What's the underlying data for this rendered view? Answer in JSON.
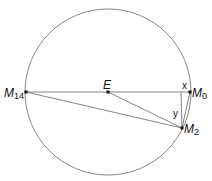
{
  "diagram": {
    "labels": {
      "center": "E",
      "m0": "M",
      "m0_sub": "0",
      "m2": "M",
      "m2_sub": "2",
      "m14": "M",
      "m14_sub": "14",
      "x": "x",
      "y": "y"
    },
    "colors": {
      "stroke": "#555555",
      "point": "#111111"
    }
  }
}
